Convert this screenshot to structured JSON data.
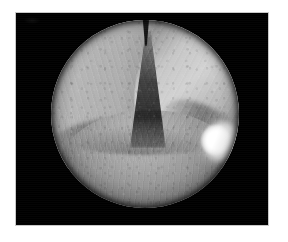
{
  "page": {
    "background_color": "#ffffff",
    "width": 288,
    "height": 242
  },
  "figure": {
    "panel_background_color": "#000000",
    "panel_border_color": "#c9c9c9",
    "panel": {
      "x": 16,
      "y": 13,
      "width": 252,
      "height": 212
    },
    "caption": "",
    "label": ""
  },
  "endoscopic_view": {
    "modality_name": "endoscopic-image",
    "color_mode": "grayscale",
    "field_shape": "circle",
    "field_of_view": {
      "center_x": 145,
      "center_y": 114,
      "diameter": 188
    },
    "vignette": "dark",
    "anatomy_label": "",
    "structures": [
      {
        "name": "left-vocal-cord",
        "position": "upper-left",
        "tone": "#b6b6b6",
        "description": "pale wedge-shaped fold with fine longitudinal striations"
      },
      {
        "name": "right-vocal-cord",
        "position": "upper-right",
        "tone": "#d2d2d2",
        "description": "brighter illuminated fold angled down-right"
      },
      {
        "name": "glottic-cleft",
        "position": "center",
        "tone": "#0e0e0e",
        "description": "dark V-shaped airway opening widening downward"
      },
      {
        "name": "anterior-commissure",
        "position": "top-center",
        "tone": "#080808",
        "description": "narrow dark notch where the folds meet"
      },
      {
        "name": "posterior-tissue-mound",
        "position": "lower-center",
        "tone": "#a8a8a8",
        "description": "rounded mucosal mound with vascular markings"
      },
      {
        "name": "specular-highlight",
        "position": "right-edge",
        "tone": "#ffffff",
        "description": "bright light reflection from the endoscope illuminator"
      }
    ]
  }
}
